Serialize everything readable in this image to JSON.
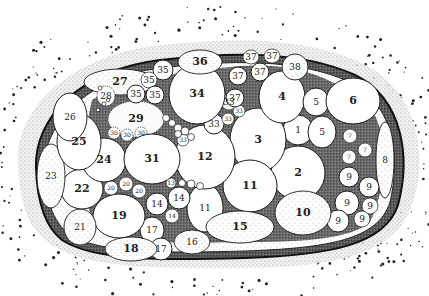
{
  "figure": {
    "type": "stippled anatomical diagram",
    "colors": {
      "ink": "#1a1a1a",
      "paper": "#ffffff",
      "stipple": "#555555"
    }
  },
  "regions": [
    {
      "id": "r1",
      "label": "1",
      "cx": 298,
      "cy": 130,
      "rx": 15,
      "ry": 15
    },
    {
      "id": "r2",
      "label": "2",
      "cx": 298,
      "cy": 173,
      "rx": 27,
      "ry": 27
    },
    {
      "id": "r3",
      "label": "3",
      "cx": 258,
      "cy": 140,
      "rx": 28,
      "ry": 32
    },
    {
      "id": "r4",
      "label": "4",
      "cx": 282,
      "cy": 97,
      "rx": 23,
      "ry": 26
    },
    {
      "id": "r5a",
      "label": "5",
      "cx": 316,
      "cy": 102,
      "rx": 13,
      "ry": 14
    },
    {
      "id": "r5b",
      "label": "5",
      "cx": 322,
      "cy": 132,
      "rx": 14,
      "ry": 16
    },
    {
      "id": "r6",
      "label": "6",
      "cx": 353,
      "cy": 101,
      "rx": 27,
      "ry": 23
    },
    {
      "id": "r7a",
      "label": "7",
      "cx": 350,
      "cy": 136,
      "rx": 7,
      "ry": 7
    },
    {
      "id": "r7b",
      "label": "7",
      "cx": 365,
      "cy": 150,
      "rx": 7,
      "ry": 7
    },
    {
      "id": "r7c",
      "label": "7",
      "cx": 349,
      "cy": 157,
      "rx": 7,
      "ry": 7
    },
    {
      "id": "r8",
      "label": "8",
      "cx": 385,
      "cy": 160,
      "rx": 9,
      "ry": 38
    },
    {
      "id": "r9a",
      "label": "9",
      "cx": 349,
      "cy": 177,
      "rx": 10,
      "ry": 10
    },
    {
      "id": "r9b",
      "label": "9",
      "cx": 369,
      "cy": 187,
      "rx": 10,
      "ry": 10
    },
    {
      "id": "r9c",
      "label": "9",
      "cx": 347,
      "cy": 203,
      "rx": 12,
      "ry": 12
    },
    {
      "id": "r9d",
      "label": "9",
      "cx": 370,
      "cy": 206,
      "rx": 8,
      "ry": 8
    },
    {
      "id": "r9e",
      "label": "9",
      "cx": 338,
      "cy": 221,
      "rx": 11,
      "ry": 11
    },
    {
      "id": "r9f",
      "label": "9",
      "cx": 362,
      "cy": 219,
      "rx": 8,
      "ry": 8
    },
    {
      "id": "r10",
      "label": "10",
      "cx": 303,
      "cy": 213,
      "rx": 28,
      "ry": 22
    },
    {
      "id": "r11a",
      "label": "11",
      "cx": 250,
      "cy": 186,
      "rx": 27,
      "ry": 26
    },
    {
      "id": "r11b",
      "label": "11",
      "cx": 205,
      "cy": 208,
      "rx": 18,
      "ry": 24
    },
    {
      "id": "r12",
      "label": "12",
      "cx": 205,
      "cy": 157,
      "rx": 30,
      "ry": 32
    },
    {
      "id": "r13",
      "label": "13",
      "cx": 171,
      "cy": 183,
      "rx": 5,
      "ry": 5
    },
    {
      "id": "r14a",
      "label": "14",
      "cx": 157,
      "cy": 204,
      "rx": 11,
      "ry": 11
    },
    {
      "id": "r14b",
      "label": "14",
      "cx": 179,
      "cy": 198,
      "rx": 11,
      "ry": 11
    },
    {
      "id": "r14c",
      "label": "14",
      "cx": 172,
      "cy": 216,
      "rx": 7,
      "ry": 7
    },
    {
      "id": "r15",
      "label": "15",
      "cx": 240,
      "cy": 227,
      "rx": 34,
      "ry": 16
    },
    {
      "id": "r16",
      "label": "16",
      "cx": 192,
      "cy": 242,
      "rx": 18,
      "ry": 12
    },
    {
      "id": "r17a",
      "label": "17",
      "cx": 152,
      "cy": 230,
      "rx": 12,
      "ry": 13
    },
    {
      "id": "r17b",
      "label": "17",
      "cx": 161,
      "cy": 249,
      "rx": 11,
      "ry": 11
    },
    {
      "id": "r18",
      "label": "18",
      "cx": 131,
      "cy": 249,
      "rx": 26,
      "ry": 12
    },
    {
      "id": "r19",
      "label": "19",
      "cx": 119,
      "cy": 216,
      "rx": 26,
      "ry": 22
    },
    {
      "id": "r20a",
      "label": "20",
      "cx": 111,
      "cy": 188,
      "rx": 7,
      "ry": 7
    },
    {
      "id": "r20b",
      "label": "20",
      "cx": 126,
      "cy": 184,
      "rx": 7,
      "ry": 7
    },
    {
      "id": "r20c",
      "label": "20",
      "cx": 139,
      "cy": 191,
      "rx": 7,
      "ry": 7
    },
    {
      "id": "r21",
      "label": "21",
      "cx": 80,
      "cy": 227,
      "rx": 16,
      "ry": 18
    },
    {
      "id": "r22",
      "label": "22",
      "cx": 82,
      "cy": 189,
      "rx": 21,
      "ry": 20
    },
    {
      "id": "r23",
      "label": "23",
      "cx": 51,
      "cy": 176,
      "rx": 14,
      "ry": 32
    },
    {
      "id": "r24",
      "label": "24",
      "cx": 104,
      "cy": 160,
      "rx": 22,
      "ry": 22
    },
    {
      "id": "r25",
      "label": "25",
      "cx": 79,
      "cy": 142,
      "rx": 22,
      "ry": 28
    },
    {
      "id": "r26",
      "label": "26",
      "cx": 70,
      "cy": 117,
      "rx": 17,
      "ry": 24
    },
    {
      "id": "r27",
      "label": "27",
      "cx": 120,
      "cy": 82,
      "rx": 36,
      "ry": 13
    },
    {
      "id": "r28",
      "label": "28",
      "cx": 106,
      "cy": 96,
      "rx": 9,
      "ry": 10
    },
    {
      "id": "r29",
      "label": "29",
      "cx": 136,
      "cy": 119,
      "rx": 28,
      "ry": 18
    },
    {
      "id": "r30a",
      "label": "30",
      "cx": 114,
      "cy": 133,
      "rx": 6,
      "ry": 6
    },
    {
      "id": "r30b",
      "label": "30",
      "cx": 127,
      "cy": 135,
      "rx": 6,
      "ry": 6
    },
    {
      "id": "r30c",
      "label": "30",
      "cx": 141,
      "cy": 133,
      "rx": 6,
      "ry": 6
    },
    {
      "id": "r31",
      "label": "31",
      "cx": 152,
      "cy": 159,
      "rx": 28,
      "ry": 25
    },
    {
      "id": "r33a",
      "label": "33",
      "cx": 183,
      "cy": 140,
      "rx": 6,
      "ry": 6
    },
    {
      "id": "r33b",
      "label": "33",
      "cx": 214,
      "cy": 124,
      "rx": 10,
      "ry": 10
    },
    {
      "id": "r33c",
      "label": "33",
      "cx": 228,
      "cy": 119,
      "rx": 6,
      "ry": 6
    },
    {
      "id": "r33d",
      "label": "33",
      "cx": 239,
      "cy": 111,
      "rx": 6,
      "ry": 6
    },
    {
      "id": "r33e",
      "label": "33",
      "cx": 229,
      "cy": 102,
      "rx": 8,
      "ry": 8
    },
    {
      "id": "r34",
      "label": "34",
      "cx": 197,
      "cy": 94,
      "rx": 28,
      "ry": 30
    },
    {
      "id": "r35a",
      "label": "35",
      "cx": 163,
      "cy": 70,
      "rx": 10,
      "ry": 10
    },
    {
      "id": "r35b",
      "label": "35",
      "cx": 149,
      "cy": 80,
      "rx": 8,
      "ry": 8
    },
    {
      "id": "r35c",
      "label": "35",
      "cx": 136,
      "cy": 94,
      "rx": 9,
      "ry": 9
    },
    {
      "id": "r35d",
      "label": "35",
      "cx": 155,
      "cy": 95,
      "rx": 9,
      "ry": 9
    },
    {
      "id": "r36",
      "label": "36",
      "cx": 200,
      "cy": 62,
      "rx": 22,
      "ry": 12
    },
    {
      "id": "r37a",
      "label": "37",
      "cx": 251,
      "cy": 57,
      "rx": 8,
      "ry": 7
    },
    {
      "id": "r37b",
      "label": "37",
      "cx": 272,
      "cy": 56,
      "rx": 8,
      "ry": 7
    },
    {
      "id": "r37c",
      "label": "37",
      "cx": 238,
      "cy": 76,
      "rx": 9,
      "ry": 9
    },
    {
      "id": "r37d",
      "label": "37",
      "cx": 260,
      "cy": 72,
      "rx": 9,
      "ry": 9
    },
    {
      "id": "r37e",
      "label": "37",
      "cx": 235,
      "cy": 98,
      "rx": 9,
      "ry": 9
    },
    {
      "id": "r38",
      "label": "38",
      "cx": 295,
      "cy": 67,
      "rx": 13,
      "ry": 13
    }
  ],
  "small_vesicles": [
    {
      "cx": 166,
      "cy": 118,
      "r": 3.5
    },
    {
      "cx": 172,
      "cy": 123,
      "r": 3.5
    },
    {
      "cx": 178,
      "cy": 128,
      "r": 4
    },
    {
      "cx": 185,
      "cy": 131,
      "r": 4
    },
    {
      "cx": 178,
      "cy": 134,
      "r": 3.5
    },
    {
      "cx": 191,
      "cy": 137,
      "r": 3.5
    },
    {
      "cx": 182,
      "cy": 183,
      "r": 3.5
    },
    {
      "cx": 191,
      "cy": 184,
      "r": 4
    },
    {
      "cx": 200,
      "cy": 186,
      "r": 3.5
    },
    {
      "cx": 100,
      "cy": 88,
      "r": 2
    },
    {
      "cx": 104,
      "cy": 104,
      "r": 2
    },
    {
      "cx": 108,
      "cy": 100,
      "r": 1.8
    },
    {
      "cx": 98,
      "cy": 110,
      "r": 1.8
    }
  ]
}
